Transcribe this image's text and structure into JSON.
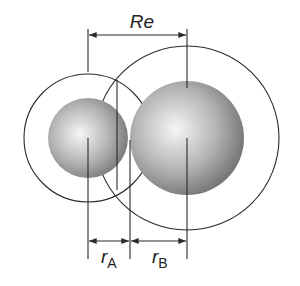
{
  "labels": {
    "re": "Re",
    "ra_main": "r",
    "ra_sub": "A",
    "rb_main": "r",
    "rb_sub": "B"
  },
  "atoms": [
    {
      "name": "A",
      "cx": 88,
      "cy": 138,
      "sphere_r": 40,
      "shell_r": 64
    },
    {
      "name": "B",
      "cx": 187,
      "cy": 138,
      "sphere_r": 57,
      "shell_r": 92
    }
  ],
  "colors": {
    "line": "#2a2a2a",
    "sphere_light": "#f4f4f4",
    "sphere_mid": "#b8b8b8",
    "sphere_dark": "#6e6e6e"
  }
}
